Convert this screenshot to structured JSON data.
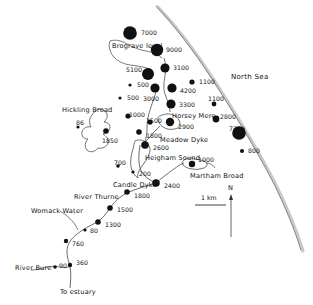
{
  "map": {
    "title": "Norfolk Broads sediment map",
    "sea_label": "North Sea",
    "estuary_label": "To estuary",
    "north_label": "N",
    "scale_label": "1 km",
    "ink_color": "#111111",
    "coast_color": "#9a9a9a",
    "water_outline_color": "#444444",
    "places": [
      {
        "name": "brograve-level",
        "label": "Brograve level",
        "x": 112,
        "y": 43
      },
      {
        "name": "north-sea",
        "label": "North Sea",
        "x": 231,
        "y": 74
      },
      {
        "name": "hickling-broad",
        "label": "Hickling Broad",
        "x": 62,
        "y": 107
      },
      {
        "name": "horsey-mere",
        "label": "Horsey Mere",
        "x": 172,
        "y": 113
      },
      {
        "name": "meadow-dyke",
        "label": "Meadow Dyke",
        "x": 160,
        "y": 137
      },
      {
        "name": "heigham-sound",
        "label": "Heigham Sound",
        "x": 145,
        "y": 155
      },
      {
        "name": "martham-broad",
        "label": "Martham Broad",
        "x": 190,
        "y": 173
      },
      {
        "name": "candle-dyke",
        "label": "Candle Dyke",
        "x": 113,
        "y": 182
      },
      {
        "name": "river-thurne",
        "label": "River Thurne",
        "x": 74,
        "y": 194
      },
      {
        "name": "womack-water",
        "label": "Womack Water",
        "x": 31,
        "y": 208
      },
      {
        "name": "river-bure",
        "label": "River Bure",
        "x": 15,
        "y": 265
      },
      {
        "name": "to-estuary",
        "label": "To estuary",
        "x": 60,
        "y": 289
      }
    ],
    "sites": [
      {
        "id": "s7000",
        "value": "7000",
        "r": 6.8,
        "cx": 130,
        "cy": 33,
        "lx": 141,
        "ly": 30
      },
      {
        "id": "s9000",
        "value": "9000",
        "r": 6.2,
        "cx": 157,
        "cy": 50,
        "lx": 166,
        "ly": 47
      },
      {
        "id": "s5100",
        "value": "5100",
        "r": 6.0,
        "cx": 148,
        "cy": 74,
        "lx": 126,
        "ly": 67
      },
      {
        "id": "s3100",
        "value": "3100",
        "r": 4.6,
        "cx": 165,
        "cy": 68,
        "lx": 173,
        "ly": 65
      },
      {
        "id": "s500a",
        "value": "500",
        "r": 1.6,
        "cx": 130,
        "cy": 85,
        "lx": 137,
        "ly": 82
      },
      {
        "id": "s1100",
        "value": "1100",
        "r": 2.6,
        "cx": 192,
        "cy": 82,
        "lx": 199,
        "ly": 79
      },
      {
        "id": "s3000",
        "value": "3000",
        "r": 4.6,
        "cx": 155,
        "cy": 88,
        "lx": 143,
        "ly": 96
      },
      {
        "id": "s4200",
        "value": "4200",
        "r": 4.6,
        "cx": 172,
        "cy": 88,
        "lx": 180,
        "ly": 88
      },
      {
        "id": "s500b",
        "value": "500",
        "r": 1.6,
        "cx": 120,
        "cy": 98,
        "lx": 127,
        "ly": 95
      },
      {
        "id": "s3300",
        "value": "3300",
        "r": 4.6,
        "cx": 171,
        "cy": 104,
        "lx": 179,
        "ly": 102
      },
      {
        "id": "s1100b",
        "value": "1100",
        "r": 2.4,
        "cx": 214,
        "cy": 104,
        "lx": 208,
        "ly": 96
      },
      {
        "id": "s1000a",
        "value": "1000",
        "r": 2.6,
        "cx": 128,
        "cy": 116,
        "lx": 129,
        "ly": 112
      },
      {
        "id": "s1500",
        "value": "1500",
        "r": 2.6,
        "cx": 150,
        "cy": 122,
        "lx": 146,
        "ly": 118
      },
      {
        "id": "s2900",
        "value": "2900",
        "r": 4.2,
        "cx": 170,
        "cy": 122,
        "lx": 178,
        "ly": 124
      },
      {
        "id": "s2800",
        "value": "2800",
        "r": 3.4,
        "cx": 216,
        "cy": 119,
        "lx": 220,
        "ly": 114
      },
      {
        "id": "s86",
        "value": "86",
        "r": 1.6,
        "cx": 78,
        "cy": 127,
        "lx": 76,
        "ly": 120
      },
      {
        "id": "s1850",
        "value": "1850",
        "r": 2.8,
        "cx": 106,
        "cy": 131,
        "lx": 102,
        "ly": 138
      },
      {
        "id": "s1800a",
        "value": "1800",
        "r": 2.8,
        "cx": 139,
        "cy": 132,
        "lx": 146,
        "ly": 133
      },
      {
        "id": "s7200",
        "value": "7200",
        "r": 6.8,
        "cx": 239,
        "cy": 133,
        "lx": 229,
        "ly": 126
      },
      {
        "id": "s2600",
        "value": "2600",
        "r": 3.8,
        "cx": 145,
        "cy": 145,
        "lx": 153,
        "ly": 145
      },
      {
        "id": "s800",
        "value": "800",
        "r": 2.0,
        "cx": 242,
        "cy": 151,
        "lx": 248,
        "ly": 148
      },
      {
        "id": "s1000b",
        "value": "1000",
        "r": 3.2,
        "cx": 192,
        "cy": 164,
        "lx": 198,
        "ly": 157
      },
      {
        "id": "s700",
        "value": "700",
        "r": 1.8,
        "cx": 118,
        "cy": 166,
        "lx": 114,
        "ly": 160
      },
      {
        "id": "s200",
        "value": "200",
        "r": 1.6,
        "cx": 133,
        "cy": 172,
        "lx": 139,
        "ly": 171
      },
      {
        "id": "s2400",
        "value": "2400",
        "r": 3.8,
        "cx": 156,
        "cy": 183,
        "lx": 164,
        "ly": 183
      },
      {
        "id": "s1800b",
        "value": "1800",
        "r": 2.8,
        "cx": 127,
        "cy": 192,
        "lx": 134,
        "ly": 193
      },
      {
        "id": "s1500b",
        "value": "1500",
        "r": 2.8,
        "cx": 110,
        "cy": 208,
        "lx": 117,
        "ly": 207
      },
      {
        "id": "s1300",
        "value": "1300",
        "r": 2.8,
        "cx": 98,
        "cy": 222,
        "lx": 105,
        "ly": 222
      },
      {
        "id": "s80",
        "value": "80",
        "r": 1.6,
        "cx": 85,
        "cy": 230,
        "lx": 90,
        "ly": 228
      },
      {
        "id": "s760",
        "value": "760",
        "r": 2.2,
        "cx": 66,
        "cy": 241,
        "lx": 72,
        "ly": 241
      },
      {
        "id": "s360",
        "value": "360",
        "r": 2.2,
        "cx": 70,
        "cy": 265,
        "lx": 76,
        "ly": 260
      },
      {
        "id": "s90",
        "value": "90",
        "r": 1.8,
        "cx": 55,
        "cy": 267,
        "lx": 59,
        "ly": 263
      }
    ]
  }
}
